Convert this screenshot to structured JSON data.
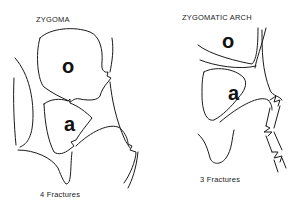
{
  "panels": [
    {
      "title": "ZYGOMA",
      "orbit_label": "o",
      "antrum_label": "a",
      "caption": "4 Fractures"
    },
    {
      "title": "ZYGOMATIC ARCH",
      "orbit_label": "o",
      "antrum_label": "a",
      "caption": "3 Fractures"
    }
  ]
}
